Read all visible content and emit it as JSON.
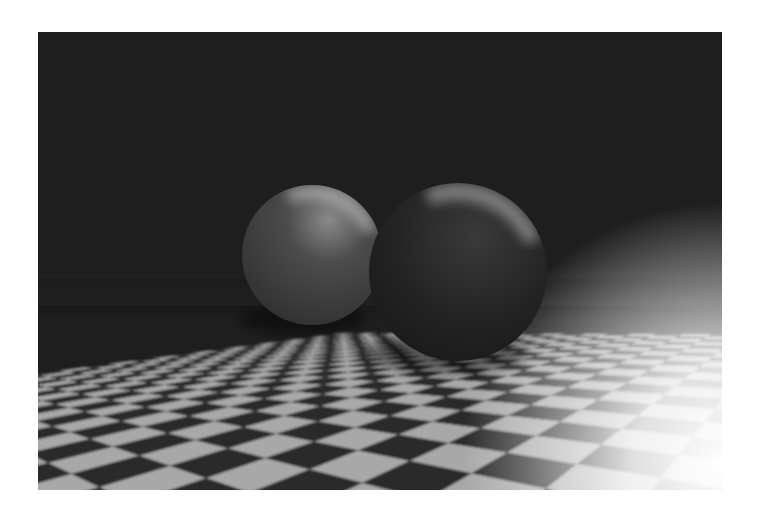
{
  "image": {
    "kind": "raytraced-render",
    "frame": {
      "x": 38,
      "y": 32,
      "width": 684,
      "height": 458
    },
    "colors": {
      "page_background": "#ffffff",
      "sky": "#1e1e1e",
      "tile_dark": "#2a2a2a",
      "tile_light": "#a8a8a8",
      "highlight": "#ffffff"
    },
    "floor": {
      "horizon_left_y": 283,
      "horizon_right_y": 243,
      "tiles_across": 16,
      "tiles_deep": 14
    },
    "spheres": [
      {
        "name": "left-sphere",
        "cx": 274,
        "cy": 223,
        "r": 70,
        "base": "#4a4a4a",
        "shade": "#2c2c2c",
        "spec": "#cfcfcf"
      },
      {
        "name": "right-sphere",
        "cx": 420,
        "cy": 240,
        "r": 89,
        "base": "#252525",
        "shade": "#161616",
        "spec": "#bdbdbd"
      }
    ]
  }
}
